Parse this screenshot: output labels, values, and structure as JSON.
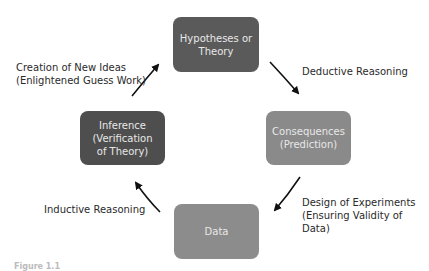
{
  "diagram": {
    "type": "cycle",
    "nodes": [
      {
        "id": "hypotheses",
        "label": "Hypotheses or\nTheory",
        "color": "#5a5a5a"
      },
      {
        "id": "consequences",
        "label": "Consequences\n(Prediction)",
        "color": "#8a8a8a"
      },
      {
        "id": "data",
        "label": "Data",
        "color": "#8c8c8c"
      },
      {
        "id": "inference",
        "label": "Inference\n(Verification\nof Theory)",
        "color": "#4e4e4e"
      }
    ],
    "edges": [
      {
        "from": "hypotheses",
        "to": "consequences",
        "label": "Deductive Reasoning"
      },
      {
        "from": "consequences",
        "to": "data",
        "label": "Design of Experiments\n(Ensuring Validity of Data)"
      },
      {
        "from": "data",
        "to": "inference",
        "label": "Inductive Reasoning"
      },
      {
        "from": "inference",
        "to": "hypotheses",
        "label": "Creation of New Ideas\n(Enlightened Guess Work)"
      }
    ],
    "caption": "Figure 1.1"
  }
}
